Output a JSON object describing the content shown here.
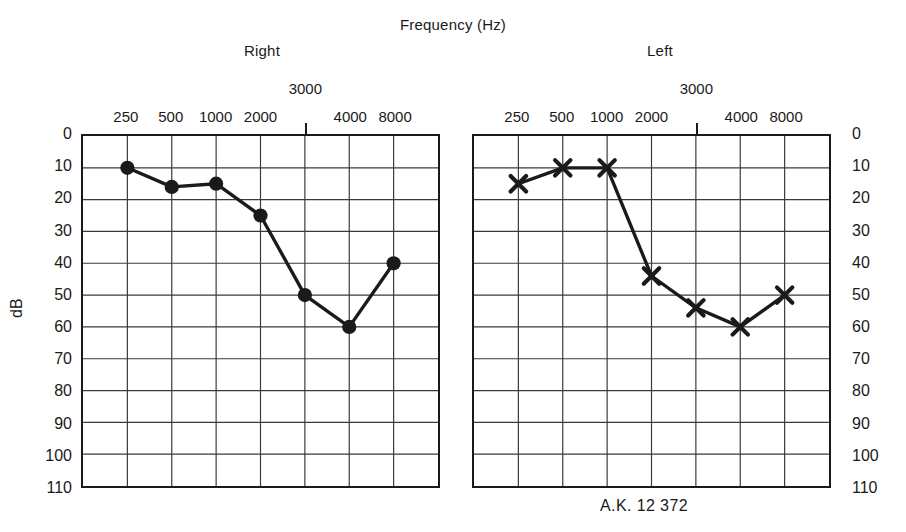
{
  "figure": {
    "axis_title": "Frequency (Hz)",
    "y_axis_label": "dB",
    "caption": "A.K. 12 372",
    "right_panel_title": "Right",
    "left_panel_title": "Left"
  },
  "chart_data": {
    "type": "line",
    "title": "Frequency (Hz)",
    "xlabel": "Frequency (Hz)",
    "ylabel": "dB",
    "ylim": [
      0,
      110
    ],
    "y_inverted": true,
    "grid": true,
    "legend": "none",
    "x_ticks": [
      "250",
      "500",
      "1000",
      "2000",
      "3000",
      "4000",
      "8000"
    ],
    "x_tick_rows": [
      "low",
      "low",
      "low",
      "low",
      "high",
      "low",
      "low"
    ],
    "y_ticks": [
      "0",
      "10",
      "20",
      "30",
      "40",
      "50",
      "60",
      "70",
      "80",
      "90",
      "100",
      "110"
    ],
    "categories": [
      250,
      500,
      1000,
      2000,
      3000,
      4000,
      8000
    ],
    "panels": [
      {
        "name": "Right",
        "marker": "filled-circle",
        "series": [
          {
            "name": "Right ear air conduction",
            "values": [
              10,
              16,
              15,
              25,
              50,
              60,
              40
            ]
          }
        ]
      },
      {
        "name": "Left",
        "marker": "x-cross",
        "series": [
          {
            "name": "Left ear air conduction",
            "values": [
              15,
              10,
              10,
              44,
              54,
              60,
              50
            ]
          }
        ]
      }
    ],
    "colors": {
      "ink": "#1a1a1a",
      "grid": "#3a3a3a",
      "background": "#ffffff"
    }
  }
}
